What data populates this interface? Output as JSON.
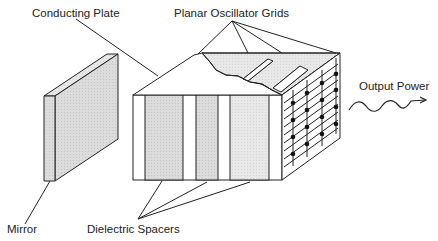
{
  "labels": {
    "conducting_plate": "Conducting Plate",
    "planar_oscillator_grids": "Planar Oscillator Grids",
    "output_power": "Output Power",
    "mirror": "Mirror",
    "dielectric_spacers": "Dielectric Spacers"
  },
  "colors": {
    "line": "#222222",
    "shade": "#d4d4d4",
    "shade_light": "#e4e4e4",
    "background": "#ffffff"
  }
}
